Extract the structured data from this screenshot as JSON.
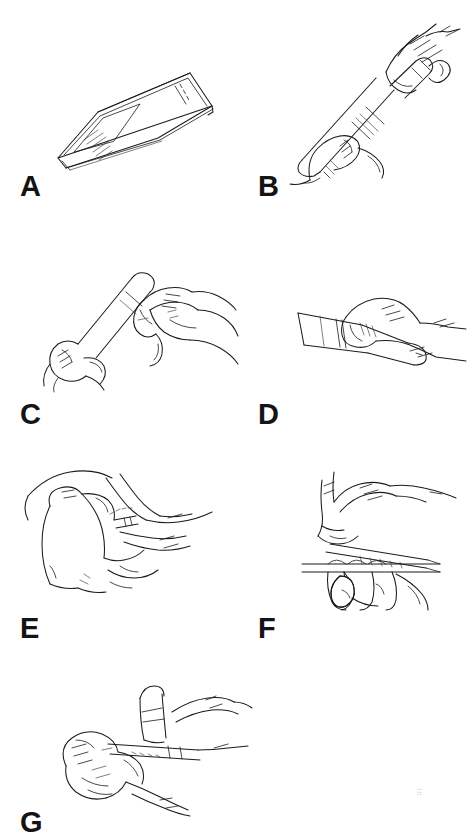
{
  "figure": {
    "style": "black and white line drawing",
    "background_color": "#ffffff",
    "ink_color": "#1b1b1b",
    "panel_count": 7,
    "layout": "two-column grid of line-art panels, each with a bold letter label beneath"
  },
  "panels": [
    {
      "id": "a",
      "label": "A",
      "caption_visible": false,
      "subject": "closed rectangular pen case lying flat, seen in perspective, with small printed label lines at one end"
    },
    {
      "id": "b",
      "label": "B",
      "caption_visible": false,
      "subject": "two hands holding the injection pen, right hand pulling off the outer needle cap"
    },
    {
      "id": "c",
      "label": "C",
      "caption_visible": false,
      "subject": "two hands holding the pen upright while removing the inner needle shield"
    },
    {
      "id": "d",
      "label": "D",
      "caption_visible": false,
      "subject": "one hand holding the pen horizontally with thumb on the dose button"
    },
    {
      "id": "e",
      "label": "E",
      "caption_visible": false,
      "subject": "hand pinching a skin fold while the other hand inserts the needle"
    },
    {
      "id": "f",
      "label": "F",
      "caption_visible": false,
      "subject": "hand peeling back a flat adhesive device held by the other hand"
    },
    {
      "id": "g",
      "label": "G",
      "caption_visible": false,
      "subject": "both hands pressing the device against the skin to complete the injection"
    }
  ],
  "device_label": {
    "line_count": 5,
    "legible": false,
    "description": "five short illegible printed text lines on the case label area"
  },
  "colors": {
    "background": "#ffffff",
    "ink": "#1b1b1b",
    "light_ink": "#3a3a3a",
    "speck": "#d8d8d8"
  }
}
